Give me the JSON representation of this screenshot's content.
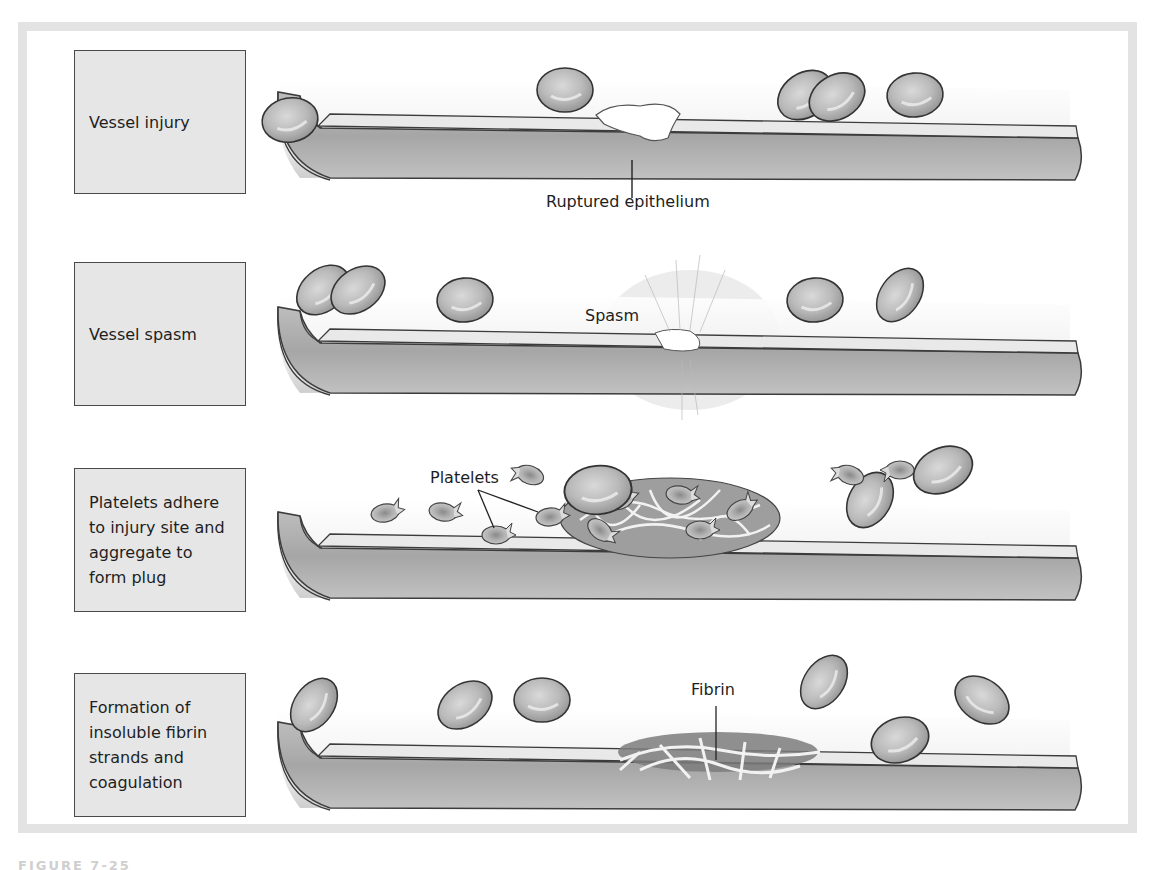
{
  "diagram": {
    "stages": [
      {
        "id": "vessel-injury",
        "label_lines": [
          "Vessel injury"
        ],
        "callouts": [
          "Ruptured epithelium"
        ]
      },
      {
        "id": "vessel-spasm",
        "label_lines": [
          "Vessel spasm"
        ],
        "callouts": [
          "Spasm"
        ]
      },
      {
        "id": "platelet-plug",
        "label_lines": [
          "Platelets adhere",
          "to injury site and",
          "aggregate to",
          "form plug"
        ],
        "callouts": [
          "Platelets"
        ]
      },
      {
        "id": "coagulation",
        "label_lines": [
          "Formation of",
          "insoluble fibrin",
          "strands and",
          "coagulation"
        ],
        "callouts": [
          "Fibrin"
        ]
      }
    ],
    "caption_partial": "FIGURE 7-25"
  },
  "colors": {
    "frame": "#e3e3e3",
    "label_box": "#e6e6e6",
    "outline": "#4a4a4a",
    "vessel_wall": "#a9a9a9",
    "cell": "#b5b5b5"
  }
}
